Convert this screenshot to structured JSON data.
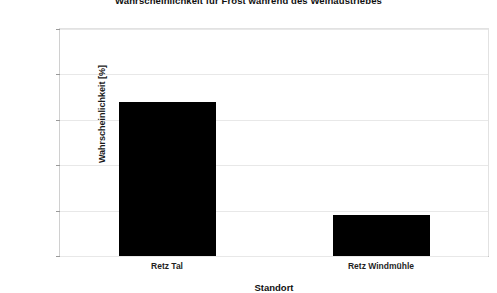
{
  "chart_data": {
    "type": "bar",
    "title": "Wahrscheinlichkeit für Frost während des Weinaustriebes",
    "xlabel": "Standort",
    "ylabel": "Wahrscheinlichkeit [%]",
    "categories": [
      "Retz Tal",
      "Retz Windmühle"
    ],
    "values": [
      68,
      18
    ],
    "series": [
      {
        "name": "Wahrscheinlichkeit [%]",
        "values": [
          68,
          18
        ]
      }
    ],
    "ylim": [
      0,
      100
    ],
    "yticks": [
      0,
      20,
      40,
      60,
      80,
      100
    ],
    "ytick_labels": [
      "0",
      "20",
      "40",
      "60",
      "80",
      "100"
    ],
    "grid": true,
    "grid_axis": "y",
    "legend": false,
    "legend_position": "none",
    "bar_color": "#000000",
    "grid_color": "#e8e8e8",
    "background_color": "#ffffff"
  },
  "axes": {
    "y_title": "Wahrscheinlichkeit [%]",
    "x_title": "Standort",
    "y_ticks": [
      {
        "value": 100,
        "label": "100"
      },
      {
        "value": 80,
        "label": "80"
      },
      {
        "value": 60,
        "label": "60"
      },
      {
        "value": 40,
        "label": "40"
      },
      {
        "value": 20,
        "label": "20"
      },
      {
        "value": 0,
        "label": "0"
      }
    ]
  },
  "bars": [
    {
      "label": "Retz Tal",
      "value": 68
    },
    {
      "label": "Retz Windmühle",
      "value": 18
    }
  ],
  "header": {
    "title": "Wahrscheinlichkeit für Frost während des Weinaustriebes"
  }
}
